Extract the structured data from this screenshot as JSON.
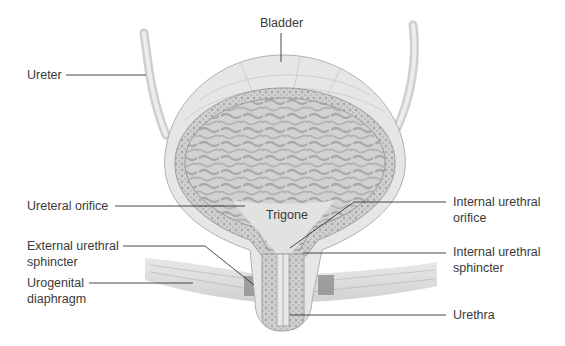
{
  "figure": {
    "labels": [
      {
        "id": "bladder",
        "text": "Bladder"
      },
      {
        "id": "ureter",
        "text": "Ureter"
      },
      {
        "id": "ureteral-orifice",
        "text": "Ureteral orifice"
      },
      {
        "id": "trigone",
        "text": "Trigone"
      },
      {
        "id": "internal-urethral-orifice",
        "text": "Internal urethral orifice",
        "lines": [
          "Internal urethral",
          "orifice"
        ]
      },
      {
        "id": "external-urethral-sphincter",
        "text": "External urethral sphincter",
        "lines": [
          "External urethral",
          "sphincter"
        ]
      },
      {
        "id": "internal-urethral-sphincter",
        "text": "Internal urethral sphincter",
        "lines": [
          "Internal urethral",
          "sphincter"
        ]
      },
      {
        "id": "urogenital-diaphragm",
        "text": "Urogenital diaphragm",
        "lines": [
          "Urogenital",
          "diaphragm"
        ]
      },
      {
        "id": "urethra",
        "text": "Urethra"
      }
    ]
  }
}
